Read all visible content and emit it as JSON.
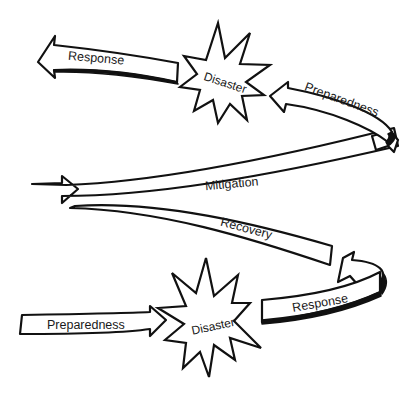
{
  "diagram": {
    "type": "spiral-cycle",
    "nodes": [
      {
        "id": "response_top",
        "kind": "arrow",
        "label": "Response"
      },
      {
        "id": "disaster_top",
        "kind": "burst",
        "label": "Disaster"
      },
      {
        "id": "preparedness_top",
        "kind": "arrow",
        "label": "Preparedness"
      },
      {
        "id": "mitigation",
        "kind": "arrow",
        "label": "Mitigation"
      },
      {
        "id": "recovery",
        "kind": "arrow",
        "label": "Recovery"
      },
      {
        "id": "response_bottom",
        "kind": "arrow",
        "label": "Response"
      },
      {
        "id": "disaster_bottom",
        "kind": "burst",
        "label": "Disaster"
      },
      {
        "id": "preparedness_bottom",
        "kind": "arrow",
        "label": "Preparedness"
      }
    ],
    "flow": [
      "Preparedness",
      "Disaster",
      "Response",
      "Recovery",
      "Mitigation",
      "Preparedness",
      "Disaster",
      "Response"
    ],
    "colors": {
      "stroke": "#111111",
      "fill": "#ffffff",
      "text": "#1a1a1a"
    }
  }
}
